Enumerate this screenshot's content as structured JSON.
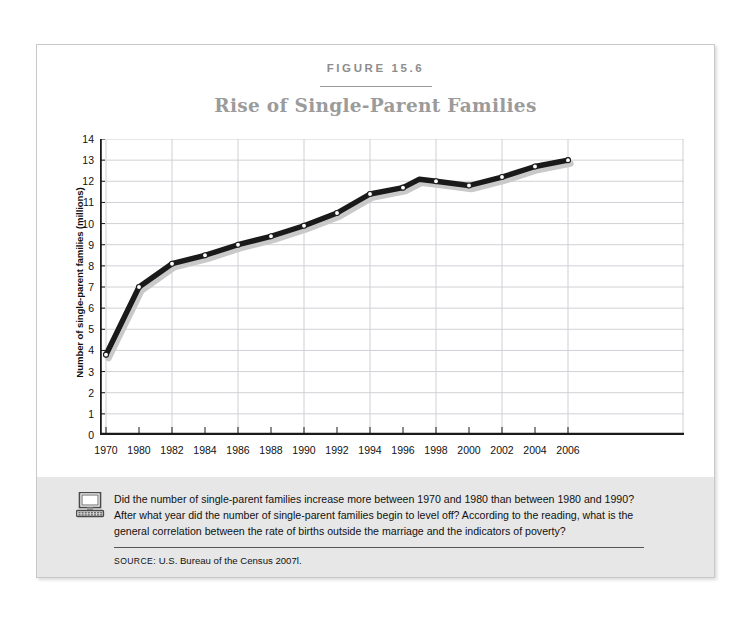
{
  "figure": {
    "number_label": "FIGURE 15.6",
    "title": "Rise of Single-Parent Families"
  },
  "caption": {
    "icon": "computer-icon",
    "text": "Did the number of single-parent families increase more between 1970 and 1980 than between 1980 and 1990? After what year did the number of single-parent families begin to level off? According to the reading, what is the general correlation between the rate of births outside the marriage and the indicators of poverty?",
    "source_label": "SOURCE:",
    "source_value": "U.S. Bureau of the Census 2007l."
  },
  "colors": {
    "line": "#1a1a1a",
    "shadow": "#c9c9c9",
    "grid": "#d0d0d6",
    "axis": "#1a1a1a",
    "title": "#9b9b9b",
    "caption_band": "#e7e7e7",
    "frame": "#c8c8c8"
  },
  "chart_data": {
    "type": "line",
    "title": "Rise of Single-Parent Families",
    "xlabel": "",
    "ylabel": "Number of single-parent families (millions)",
    "ylim": [
      0,
      14
    ],
    "ytick_step": 1,
    "grid": true,
    "legend": "none",
    "marker": "open-circle",
    "categories": [
      "1970",
      "1980",
      "1982",
      "1984",
      "1986",
      "1988",
      "1990",
      "1992",
      "1994",
      "1996",
      "1997",
      "1998",
      "2000",
      "2002",
      "2004",
      "2006"
    ],
    "x_tick_labels": [
      "1970",
      "1980",
      "1982",
      "1984",
      "1986",
      "1988",
      "1990",
      "1992",
      "1994",
      "1996",
      "1998",
      "2000",
      "2002",
      "2004",
      "2006"
    ],
    "y_tick_labels": [
      "14",
      "13",
      "12",
      "11",
      "10",
      "9",
      "8",
      "7",
      "6",
      "5",
      "4",
      "3",
      "2",
      "1",
      "0"
    ],
    "values": [
      3.8,
      7.0,
      8.1,
      8.5,
      9.0,
      9.4,
      9.9,
      10.5,
      11.4,
      11.7,
      12.1,
      12.0,
      11.8,
      12.2,
      12.7,
      13.0
    ],
    "series": [
      {
        "name": "Single-parent families",
        "points": [
          {
            "x": "1970",
            "y": 3.8
          },
          {
            "x": "1980",
            "y": 7.0
          },
          {
            "x": "1982",
            "y": 8.1
          },
          {
            "x": "1984",
            "y": 8.5
          },
          {
            "x": "1986",
            "y": 9.0
          },
          {
            "x": "1988",
            "y": 9.4
          },
          {
            "x": "1990",
            "y": 9.9
          },
          {
            "x": "1992",
            "y": 10.5
          },
          {
            "x": "1994",
            "y": 11.4
          },
          {
            "x": "1996",
            "y": 11.7
          },
          {
            "x": "1997",
            "y": 12.1
          },
          {
            "x": "1998",
            "y": 12.0
          },
          {
            "x": "2000",
            "y": 11.8
          },
          {
            "x": "2002",
            "y": 12.2
          },
          {
            "x": "2004",
            "y": 12.7
          },
          {
            "x": "2006",
            "y": 13.0
          }
        ]
      }
    ]
  }
}
